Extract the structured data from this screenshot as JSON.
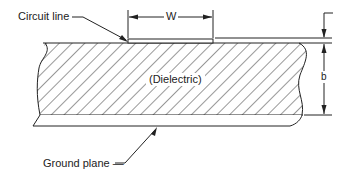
{
  "diagram": {
    "type": "microstrip cross-section",
    "labels": {
      "circuit_line": "Circuit line",
      "width": "W",
      "dielectric": "(Dielectric)",
      "height": "b",
      "ground_plane": "Ground plane —"
    },
    "colors": {
      "line": "#222222",
      "background": "#ffffff"
    }
  }
}
